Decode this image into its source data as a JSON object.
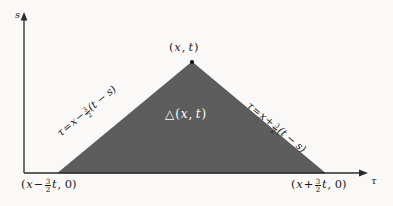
{
  "figure": {
    "type": "math-diagram",
    "background_color": "#faf9f7",
    "fill_color": "#5d5d5d",
    "axis_color": "#2b2b2b",
    "text_color": "#1a1a1a"
  },
  "axes": {
    "vertical": {
      "name": "s",
      "icon": "arrow-up-icon",
      "x": 24,
      "top_y": 16,
      "bottom_y": 173
    },
    "horizontal": {
      "name": "τ",
      "icon": "arrow-right-icon",
      "y": 173,
      "left_x": 24,
      "right_x": 366
    }
  },
  "triangle": {
    "apex": {
      "label_tau": "x",
      "label_s": "t",
      "label": "(x, t)",
      "point_x": 192,
      "point_y": 62,
      "marker": "dot-marker"
    },
    "vertex_left": {
      "label_prefix": "(",
      "label_var": "x",
      "label_op": "−",
      "label_num": "3",
      "label_den": "2",
      "label_t": "t",
      "label_suffix": ", 0)",
      "point_x": 58,
      "point_y": 173
    },
    "vertex_right": {
      "label_prefix": "(",
      "label_var": "x",
      "label_op": "+",
      "label_num": "3",
      "label_den": "2",
      "label_t": "t",
      "label_suffix": ", 0)",
      "point_x": 325,
      "point_y": 173
    },
    "region": {
      "glyph": "△",
      "label": "△(x, t)",
      "args": "(x, t)"
    }
  },
  "edges": {
    "left": {
      "lhs": "τ",
      "equals": "=",
      "var": "x",
      "op": "−",
      "num": "3",
      "den": "2",
      "factor": "(t − s)",
      "equation": "τ = x − 3/2(t − s)",
      "rotation_deg": -39.6
    },
    "right": {
      "lhs": "τ",
      "equals": "=",
      "var": "x",
      "op": "+",
      "num": "3",
      "den": "2",
      "factor": "(t − s)",
      "equation": "τ = x + 3/2(t − s)",
      "rotation_deg": 39.5
    }
  }
}
